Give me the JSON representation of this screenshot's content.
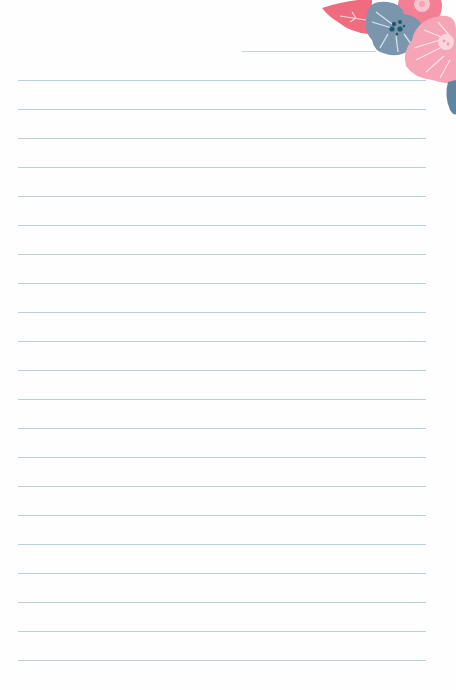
{
  "page": {
    "type": "lined-stationery",
    "background_color": "#fefefe",
    "line_color": "#b9cfd9",
    "line_count": 21,
    "first_line_y": 80,
    "line_spacing": 29,
    "line_left": 18,
    "line_right": 426,
    "header_line": {
      "x_start": 242,
      "x_end": 376,
      "y": 51
    }
  },
  "decoration": {
    "name": "floral-corner",
    "colors": {
      "coral_leaf": "#ef6b7e",
      "blue_flower": "#7a95ab",
      "blue_center": "#1f5a73",
      "pink_flower": "#f59aae",
      "light_pink_flower": "#f7b4c2",
      "blue_petal": "#5f86a0"
    }
  }
}
